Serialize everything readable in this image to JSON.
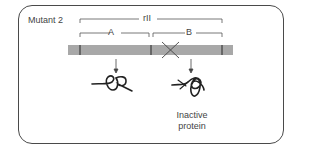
{
  "title": "Mutant 2",
  "gene_label": "rII",
  "segments": [
    {
      "label": "A"
    },
    {
      "label": "B"
    }
  ],
  "mutation_marker": "X",
  "proteins": [
    {
      "position": "A",
      "caption": ""
    },
    {
      "position": "B",
      "caption_line1": "Inactive",
      "caption_line2": "protein"
    }
  ],
  "colors": {
    "bar": "#a8a8a8",
    "frame": "#4a4a4a",
    "ink": "#333333"
  }
}
